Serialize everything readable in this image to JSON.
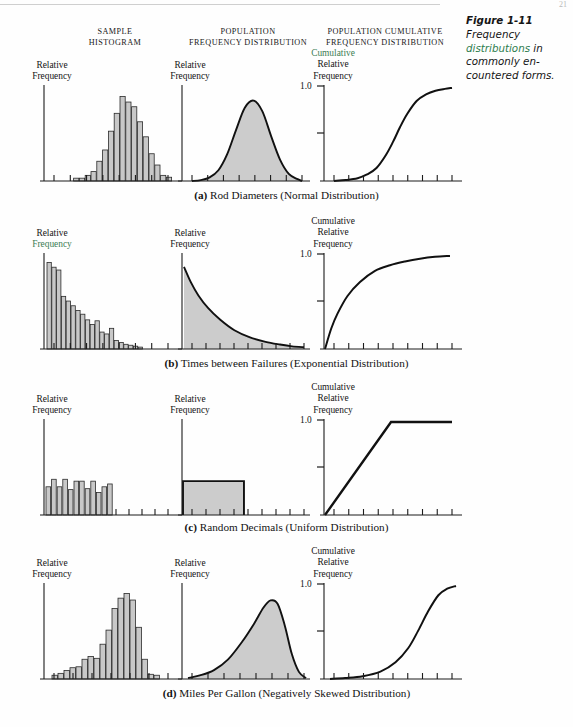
{
  "page": {
    "number": "21",
    "column_headings": [
      {
        "lines": [
          "SAMPLE",
          "HISTOGRAM"
        ]
      },
      {
        "lines": [
          "POPULATION",
          "FREQUENCY DISTRIBUTION"
        ]
      },
      {
        "lines": [
          "POPULATION CUMULATIVE",
          "FREQUENCY DISTRIBUTION"
        ]
      }
    ],
    "caption": {
      "figure_number": "Figure 1-11",
      "line1": "Frequency",
      "line2_green": "distributions",
      "line2_rest": " in",
      "line3": "commonly en-",
      "line4": "countered forms."
    },
    "axis_labels": {
      "relative": "Relative",
      "frequency": "Frequency",
      "cumulative": "Cumulative",
      "one_point_zero": "1.0"
    },
    "accent_green": "#3c7d53",
    "fill_gray": "#c9c9c9",
    "row_captions": [
      {
        "tag": "(a)",
        "text": " Rod Diameters (Normal Distribution)"
      },
      {
        "tag": "(b)",
        "text": " Times between Failures (Exponential Distribution)"
      },
      {
        "tag": "(c)",
        "text": " Random Decimals (Uniform Distribution)"
      },
      {
        "tag": "(d)",
        "text": " Miles Per Gallon (Negatively Skewed Distribution)"
      }
    ]
  },
  "chart_data": [
    {
      "type": "bar",
      "id": "row-a-sample-histogram",
      "title": "Sample Histogram - Rod Diameters",
      "xlabel": "",
      "ylabel": "Relative Frequency",
      "grid": false,
      "ylim": [
        0,
        1
      ],
      "categories": [
        "1",
        "2",
        "3",
        "4",
        "5",
        "6",
        "7",
        "8",
        "9",
        "10",
        "11",
        "12",
        "13",
        "14",
        "15",
        "16",
        "17",
        "18",
        "19",
        "20"
      ],
      "values": [
        0.0,
        0.0,
        0.03,
        0.03,
        0.06,
        0.1,
        0.21,
        0.33,
        0.53,
        0.72,
        0.9,
        0.84,
        0.79,
        0.63,
        0.47,
        0.29,
        0.17,
        0.06,
        0.04,
        0.0
      ]
    },
    {
      "type": "area",
      "id": "row-a-population-normal",
      "title": "Population Frequency Distribution - Normal",
      "xlabel": "",
      "ylabel": "Relative Frequency",
      "grid": false,
      "x": [
        0,
        0.08,
        0.16,
        0.24,
        0.32,
        0.4,
        0.48,
        0.56,
        0.64,
        0.72,
        0.8,
        0.88,
        0.96,
        1.0
      ],
      "y": [
        0.0,
        0.01,
        0.04,
        0.12,
        0.3,
        0.57,
        0.82,
        0.9,
        0.78,
        0.5,
        0.24,
        0.08,
        0.02,
        0.0
      ],
      "ylim": [
        0,
        1
      ]
    },
    {
      "type": "line",
      "id": "row-a-cumulative-normal",
      "title": "Population Cumulative Frequency Distribution - Normal",
      "xlabel": "",
      "ylabel": "Cumulative Relative Frequency",
      "grid": false,
      "ylim": [
        0,
        1.0
      ],
      "yticks": [
        0.5,
        1.0
      ],
      "ytick_labels": [
        "",
        "1.0"
      ],
      "x": [
        0,
        0.1,
        0.2,
        0.28,
        0.36,
        0.44,
        0.5,
        0.56,
        0.62,
        0.7,
        0.78,
        0.86,
        0.94,
        1.0
      ],
      "y": [
        0.0,
        0.01,
        0.03,
        0.07,
        0.14,
        0.28,
        0.42,
        0.58,
        0.72,
        0.86,
        0.93,
        0.97,
        0.99,
        1.0
      ]
    },
    {
      "type": "bar",
      "id": "row-b-sample-histogram",
      "title": "Sample Histogram - Times between Failures",
      "ylabel": "Relative Frequency",
      "grid": false,
      "ylim": [
        0,
        1
      ],
      "categories": [
        "1",
        "2",
        "3",
        "4",
        "5",
        "6",
        "7",
        "8",
        "9",
        "10",
        "11",
        "12",
        "13",
        "14",
        "15",
        "16",
        "17",
        "18",
        "19",
        "20"
      ],
      "values": [
        0.92,
        0.87,
        0.84,
        0.56,
        0.51,
        0.46,
        0.41,
        0.37,
        0.31,
        0.26,
        0.3,
        0.18,
        0.16,
        0.22,
        0.09,
        0.07,
        0.05,
        0.04,
        0.03,
        0.02
      ]
    },
    {
      "type": "area",
      "id": "row-b-population-exponential",
      "title": "Population Frequency Distribution - Exponential",
      "ylabel": "Relative Frequency",
      "grid": false,
      "x": [
        0,
        0.06,
        0.12,
        0.2,
        0.3,
        0.42,
        0.55,
        0.68,
        0.8,
        0.9,
        1.0
      ],
      "y": [
        0.92,
        0.74,
        0.6,
        0.46,
        0.33,
        0.21,
        0.13,
        0.08,
        0.05,
        0.03,
        0.02
      ],
      "ylim": [
        0,
        1
      ]
    },
    {
      "type": "line",
      "id": "row-b-cumulative-exponential",
      "title": "Population Cumulative Frequency Distribution - Exponential",
      "ylabel": "Cumulative Relative Frequency",
      "grid": false,
      "ylim": [
        0,
        1.0
      ],
      "yticks": [
        0.5,
        1.0
      ],
      "ytick_labels": [
        "",
        "1.0"
      ],
      "x": [
        0,
        0.05,
        0.1,
        0.18,
        0.28,
        0.4,
        0.52,
        0.64,
        0.76,
        0.88,
        1.0
      ],
      "y": [
        0.0,
        0.22,
        0.38,
        0.57,
        0.72,
        0.84,
        0.9,
        0.94,
        0.97,
        0.99,
        1.0
      ]
    },
    {
      "type": "bar",
      "id": "row-c-sample-histogram",
      "title": "Sample Histogram - Random Decimals",
      "ylabel": "Relative Frequency",
      "grid": false,
      "ylim": [
        0,
        1
      ],
      "categories": [
        "1",
        "2",
        "3",
        "4",
        "5",
        "6",
        "7",
        "8",
        "9",
        "10",
        "11",
        "12"
      ],
      "values": [
        0.3,
        0.38,
        0.3,
        0.38,
        0.27,
        0.36,
        0.36,
        0.28,
        0.36,
        0.24,
        0.3,
        0.33
      ]
    },
    {
      "type": "area",
      "id": "row-c-population-uniform",
      "title": "Population Frequency Distribution - Uniform",
      "ylabel": "Relative Frequency",
      "grid": false,
      "x": [
        0,
        0.0,
        0.48,
        0.48
      ],
      "y": [
        0,
        0.36,
        0.36,
        0
      ],
      "ylim": [
        0,
        1
      ]
    },
    {
      "type": "line",
      "id": "row-c-cumulative-uniform",
      "title": "Population Cumulative Frequency Distribution - Uniform",
      "ylabel": "Cumulative Relative Frequency",
      "grid": false,
      "ylim": [
        0,
        1.0
      ],
      "yticks": [
        0.5,
        1.0
      ],
      "ytick_labels": [
        "",
        "1.0"
      ],
      "x": [
        0,
        0.52,
        1.0
      ],
      "y": [
        0,
        1.0,
        1.0
      ]
    },
    {
      "type": "bar",
      "id": "row-d-sample-histogram",
      "title": "Sample Histogram - Miles Per Gallon",
      "ylabel": "Relative Frequency",
      "grid": false,
      "ylim": [
        0,
        1
      ],
      "categories": [
        "1",
        "2",
        "3",
        "4",
        "5",
        "6",
        "7",
        "8",
        "9",
        "10",
        "11",
        "12",
        "13",
        "14",
        "15",
        "16",
        "17",
        "18"
      ],
      "values": [
        0.04,
        0.06,
        0.09,
        0.12,
        0.13,
        0.21,
        0.24,
        0.22,
        0.37,
        0.52,
        0.75,
        0.86,
        0.91,
        0.84,
        0.55,
        0.21,
        0.05,
        0.04
      ]
    },
    {
      "type": "area",
      "id": "row-d-population-negskew",
      "title": "Population Frequency Distribution - Negatively Skewed",
      "ylabel": "Relative Frequency",
      "grid": false,
      "x": [
        0,
        0.1,
        0.22,
        0.34,
        0.46,
        0.56,
        0.64,
        0.7,
        0.76,
        0.82,
        0.88,
        0.94,
        1.0
      ],
      "y": [
        0.01,
        0.04,
        0.1,
        0.22,
        0.42,
        0.62,
        0.8,
        0.88,
        0.84,
        0.6,
        0.28,
        0.08,
        0.01
      ],
      "ylim": [
        0,
        1
      ]
    },
    {
      "type": "line",
      "id": "row-d-cumulative-negskew",
      "title": "Population Cumulative Frequency Distribution - Negatively Skewed",
      "ylabel": "Cumulative Relative Frequency",
      "grid": false,
      "ylim": [
        0,
        1.0
      ],
      "yticks": [
        0.5,
        1.0
      ],
      "ytick_labels": [
        "",
        "1.0"
      ],
      "x": [
        0,
        0.12,
        0.26,
        0.4,
        0.52,
        0.62,
        0.7,
        0.78,
        0.86,
        0.93,
        1.0
      ],
      "y": [
        0.0,
        0.01,
        0.03,
        0.08,
        0.18,
        0.33,
        0.52,
        0.73,
        0.9,
        0.97,
        1.0
      ]
    }
  ]
}
